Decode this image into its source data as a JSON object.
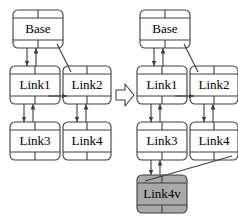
{
  "diagram": {
    "colors": {
      "stroke": "#3f3f3f",
      "node_fill": "#ffffff",
      "highlight_fill": "#a9a9a9",
      "background": "#ffffff",
      "text": "#000000"
    },
    "transform_arrow": {
      "icon": "block-arrow-right-icon",
      "direction": "right"
    },
    "panels": [
      {
        "id": "before",
        "nodes": [
          {
            "id": "base_l",
            "label": "Base",
            "x": 13,
            "y": 10,
            "w": 50,
            "h": 38,
            "fill": "node"
          },
          {
            "id": "link1_l",
            "label": "Link1",
            "x": 10,
            "y": 66,
            "w": 50,
            "h": 38,
            "fill": "node"
          },
          {
            "id": "link2_l",
            "label": "Link2",
            "x": 63,
            "y": 66,
            "w": 48,
            "h": 38,
            "fill": "node"
          },
          {
            "id": "link3_l",
            "label": "Link3",
            "x": 10,
            "y": 122,
            "w": 50,
            "h": 38,
            "fill": "node"
          },
          {
            "id": "link4_l",
            "label": "Link4",
            "x": 63,
            "y": 122,
            "w": 48,
            "h": 38,
            "fill": "node"
          }
        ],
        "edges": [
          {
            "from": "base_l",
            "to": "link1_l",
            "kind": "double-vertical"
          },
          {
            "from": "base_l",
            "to": "link2_l",
            "kind": "diagonal"
          },
          {
            "from": "link1_l",
            "to": "link2_l",
            "kind": "horizontal"
          },
          {
            "from": "link1_l",
            "to": "link3_l",
            "kind": "double-vertical"
          },
          {
            "from": "link2_l",
            "to": "link4_l",
            "kind": "double-vertical"
          }
        ]
      },
      {
        "id": "after",
        "nodes": [
          {
            "id": "base_r",
            "label": "Base",
            "x": 140,
            "y": 10,
            "w": 50,
            "h": 38,
            "fill": "node"
          },
          {
            "id": "link1_r",
            "label": "Link1",
            "x": 137,
            "y": 66,
            "w": 50,
            "h": 38,
            "fill": "node"
          },
          {
            "id": "link2_r",
            "label": "Link2",
            "x": 190,
            "y": 66,
            "w": 48,
            "h": 38,
            "fill": "node"
          },
          {
            "id": "link3_r",
            "label": "Link3",
            "x": 137,
            "y": 122,
            "w": 50,
            "h": 38,
            "fill": "node"
          },
          {
            "id": "link4_r",
            "label": "Link4",
            "x": 190,
            "y": 122,
            "w": 48,
            "h": 38,
            "fill": "node"
          },
          {
            "id": "link4v",
            "label": "Link4v",
            "x": 137,
            "y": 175,
            "w": 50,
            "h": 38,
            "fill": "highlight"
          }
        ],
        "edges": [
          {
            "from": "base_r",
            "to": "link1_r",
            "kind": "double-vertical"
          },
          {
            "from": "base_r",
            "to": "link2_r",
            "kind": "diagonal"
          },
          {
            "from": "link1_r",
            "to": "link2_r",
            "kind": "horizontal"
          },
          {
            "from": "link1_r",
            "to": "link3_r",
            "kind": "double-vertical"
          },
          {
            "from": "link2_r",
            "to": "link4_r",
            "kind": "double-vertical"
          },
          {
            "from": "link3_r",
            "to": "link4v",
            "kind": "double-vertical"
          },
          {
            "from": "link4_r",
            "to": "link4v",
            "kind": "diagonal"
          }
        ]
      }
    ]
  }
}
